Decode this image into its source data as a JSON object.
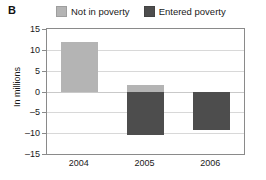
{
  "panel": {
    "letter": "B"
  },
  "legend": {
    "position": "top",
    "items": [
      {
        "label": "Not in poverty",
        "color": "#b4b4b4",
        "icon": "square-swatch-icon"
      },
      {
        "label": "Entered poverty",
        "color": "#4d4d4d",
        "icon": "square-swatch-icon"
      }
    ]
  },
  "chart_data": {
    "type": "bar",
    "title": "",
    "subtitle": "",
    "xlabel": "",
    "ylabel": "In millions",
    "categories": [
      "2004",
      "2005",
      "2006"
    ],
    "series": [
      {
        "name": "Not in poverty",
        "color": "#b4b4b4",
        "values": [
          12,
          1.5,
          0
        ]
      },
      {
        "name": "Entered poverty",
        "color": "#4d4d4d",
        "values": [
          0,
          -10.5,
          -9.3
        ]
      }
    ],
    "ylim": [
      -15,
      15
    ],
    "yticks": [
      15,
      10,
      5,
      0,
      -5,
      -10,
      -15
    ],
    "ytick_labels": [
      "15",
      "10",
      "5",
      "0",
      "–5",
      "–10",
      "–15"
    ],
    "grid": true,
    "legend_position": "top"
  }
}
